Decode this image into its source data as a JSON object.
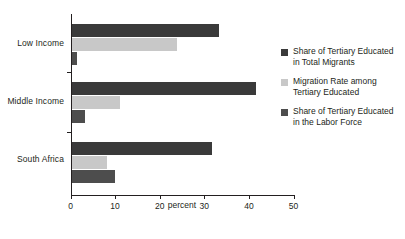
{
  "chart_data": {
    "type": "bar",
    "orientation": "horizontal",
    "title": "",
    "xlabel": "percent",
    "ylabel": "",
    "xlim": [
      0,
      50
    ],
    "xticks": [
      0,
      10,
      20,
      30,
      40,
      50
    ],
    "xtick_labels": [
      "0",
      "10",
      "20",
      "30",
      "40",
      "50"
    ],
    "grid": false,
    "legend_position": "right",
    "categories": [
      "Low Income",
      "Middle Income",
      "South Africa"
    ],
    "series": [
      {
        "name": "Share of Tertiary Educated in Total Migrants",
        "color": "#3a3a3a",
        "values": [
          33.1,
          41.4,
          31.6
        ]
      },
      {
        "name": "Migration Rate among Tertiary Educated",
        "color": "#c8c8c8",
        "values": [
          23.7,
          10.9,
          7.9
        ]
      },
      {
        "name": "Share of Tertiary Educated in the Labor Force",
        "color": "#4d4d4d",
        "values": [
          1.2,
          3.0,
          9.7
        ]
      }
    ]
  },
  "legend": {
    "items": [
      {
        "line1": "Share of Tertiary Educated",
        "line2": "in Total Migrants"
      },
      {
        "line1": "Migration Rate among",
        "line2": "Tertiary Educated"
      },
      {
        "line1": "Share of Tertiary Educated",
        "line2": "in the Labor Force"
      }
    ]
  },
  "axis": {
    "x_title": "percent"
  }
}
